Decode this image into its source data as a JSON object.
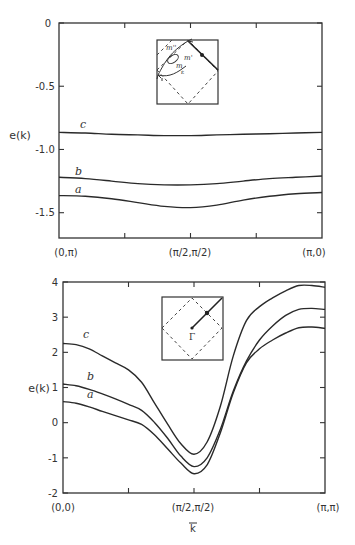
{
  "chart_data": [
    {
      "type": "line",
      "title": "",
      "xlabel": "",
      "ylabel": "e(k)",
      "x_tick_labels": [
        "(0,π)",
        "(π/2,π/2)",
        "(π,0)"
      ],
      "y_ticks": [
        0,
        -0.5,
        -1.0,
        -1.5
      ],
      "y_tick_labels": [
        "0",
        "-0.5",
        "-1.0",
        "-1.5"
      ],
      "ylim": [
        -1.7,
        0
      ],
      "xlim": [
        0,
        1
      ],
      "grid": false,
      "x": [
        0,
        0.1,
        0.2,
        0.3,
        0.4,
        0.5,
        0.6,
        0.7,
        0.8,
        0.9,
        1.0
      ],
      "series": [
        {
          "name": "a",
          "values": [
            -1.365,
            -1.37,
            -1.39,
            -1.42,
            -1.45,
            -1.46,
            -1.44,
            -1.4,
            -1.37,
            -1.35,
            -1.34
          ]
        },
        {
          "name": "b",
          "values": [
            -1.22,
            -1.23,
            -1.25,
            -1.27,
            -1.28,
            -1.28,
            -1.27,
            -1.25,
            -1.23,
            -1.22,
            -1.21
          ]
        },
        {
          "name": "c",
          "values": [
            -0.865,
            -0.87,
            -0.88,
            -0.885,
            -0.89,
            -0.89,
            -0.885,
            -0.88,
            -0.875,
            -0.87,
            -0.865
          ]
        }
      ],
      "inset": {
        "description": "Brillouin zone with dashed diamond, path from (0,π) to (π,0), contour labels m, m', m''",
        "labels": [
          "m''",
          "m'",
          "m"
        ]
      }
    },
    {
      "type": "line",
      "title": "",
      "xlabel": "k⃗",
      "ylabel": "e(k)",
      "x_tick_labels": [
        "(0,0)",
        "(π/2,π/2)",
        "(π,π)"
      ],
      "y_ticks": [
        4,
        3,
        2,
        1,
        0,
        -1,
        -2
      ],
      "y_tick_labels": [
        "4",
        "3",
        "2",
        "1",
        "0",
        "-1",
        "-2"
      ],
      "ylim": [
        -2,
        4
      ],
      "xlim": [
        0,
        1
      ],
      "grid": false,
      "x": [
        0,
        0.05,
        0.1,
        0.15,
        0.2,
        0.25,
        0.3,
        0.35,
        0.4,
        0.45,
        0.5,
        0.55,
        0.6,
        0.65,
        0.7,
        0.75,
        0.8,
        0.85,
        0.9,
        0.95,
        1.0
      ],
      "series": [
        {
          "name": "a",
          "values": [
            0.6,
            0.55,
            0.45,
            0.32,
            0.2,
            0.08,
            -0.05,
            -0.35,
            -0.75,
            -1.15,
            -1.45,
            -1.2,
            -0.3,
            0.85,
            1.7,
            2.1,
            2.35,
            2.55,
            2.7,
            2.72,
            2.68
          ]
        },
        {
          "name": "b",
          "values": [
            1.1,
            1.05,
            0.95,
            0.82,
            0.68,
            0.52,
            0.35,
            0.0,
            -0.45,
            -0.95,
            -1.25,
            -1.0,
            -0.2,
            0.9,
            1.75,
            2.35,
            2.75,
            3.05,
            3.22,
            3.25,
            3.22
          ]
        },
        {
          "name": "c",
          "values": [
            2.25,
            2.22,
            2.1,
            1.9,
            1.7,
            1.5,
            1.15,
            0.55,
            -0.05,
            -0.6,
            -0.9,
            -0.55,
            0.45,
            1.9,
            2.9,
            3.3,
            3.55,
            3.75,
            3.9,
            3.9,
            3.85
          ]
        }
      ],
      "inset": {
        "description": "Brillouin zone with dashed diamond, path from Γ toward (π,π) with midpoint dot",
        "labels": [
          "Γ"
        ]
      }
    }
  ],
  "top_chart": {
    "ylabel": "e(k)",
    "yticks": [
      "0",
      "-0.5",
      "-1.0",
      "-1.5"
    ],
    "xticks": [
      "(0,π)",
      "(π/2,π/2)",
      "(π,0)"
    ],
    "series_labels": [
      "a",
      "b",
      "c"
    ],
    "inset_labels": [
      "m''",
      "m'",
      "m",
      "ε"
    ]
  },
  "bottom_chart": {
    "ylabel": "e(k)",
    "yticks": [
      "4",
      "3",
      "2",
      "1",
      "0",
      "-1",
      "-2"
    ],
    "xticks": [
      "(0,0)",
      "(π/2,π/2)",
      "(π,π)"
    ],
    "xlabel": "k",
    "xlabel_arrow": "→",
    "series_labels": [
      "a",
      "b",
      "c"
    ],
    "inset_labels": [
      "Γ"
    ]
  }
}
